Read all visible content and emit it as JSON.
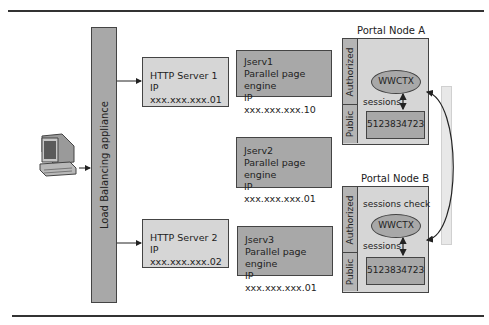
{
  "diagram": {
    "load_balancer": {
      "label": "Load Balancing appliance"
    },
    "client": {
      "icon": "desktop-computer-icon"
    },
    "http_servers": [
      {
        "name": "HTTP Server 1",
        "ip": "IP xxx.xxx.xxx.01"
      },
      {
        "name": "HTTP Server 2",
        "ip": "IP xxx.xxx.xxx.02"
      }
    ],
    "jservs": [
      {
        "name": "Jserv1",
        "role": "Parallel page engine",
        "ip": "IP xxx.xxx.xxx.10"
      },
      {
        "name": "Jserv2",
        "role": "Parallel page engine",
        "ip": "IP xxx.xxx.xxx.01"
      },
      {
        "name": "Jserv3",
        "role": "Parallel page engine",
        "ip": "IP xxx.xxx.xxx.01"
      }
    ],
    "portal_nodes": [
      {
        "title": "Portal Node A",
        "authorized_label": "Authorized",
        "public_label": "Public",
        "context": "WWCTX",
        "sessions_label": "sessions",
        "session_id": "5123834723"
      },
      {
        "title": "Portal Node B",
        "authorized_label": "Authorized",
        "public_label": "Public",
        "check_label": "sessions check",
        "context": "WWCTX",
        "sessions_label": "sessions",
        "session_id": "5123834723"
      }
    ],
    "colors": {
      "light_fill": "#d6d6d6",
      "dark_fill": "#a8a8a8",
      "stroke": "#444444",
      "side_bar": "#e8e8e8"
    }
  }
}
